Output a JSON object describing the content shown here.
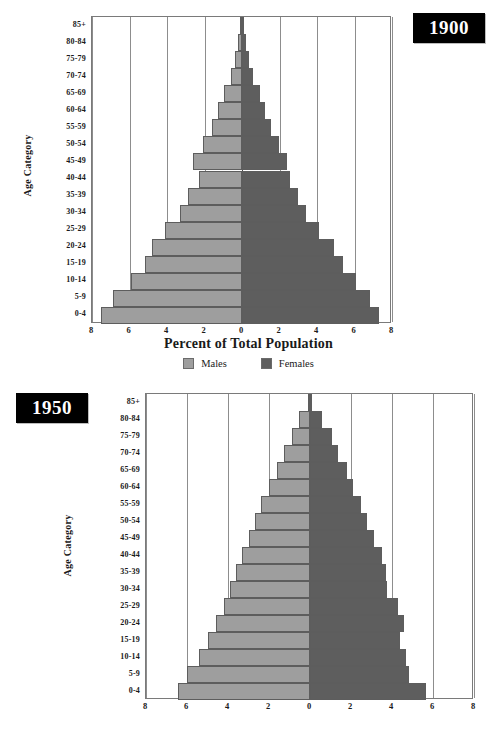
{
  "page": {
    "background": "#ffffff"
  },
  "colors": {
    "male": "#9e9e9e",
    "female": "#5e5e5e",
    "badge_background": "#000000",
    "badge_text": "#ffffff",
    "gridline": "#8d8d8d",
    "axis": "#7a7a7a"
  },
  "legend": {
    "position": "bottom-center",
    "items": [
      {
        "label": "Males",
        "color": "#9e9e9e",
        "swatch": "square-swatch"
      },
      {
        "label": "Females",
        "color": "#5e5e5e",
        "swatch": "square-swatch"
      }
    ]
  },
  "axis": {
    "ylabel": "Age Category",
    "xlabel": "Percent of Total Population",
    "xticks": [
      "8",
      "6",
      "4",
      "2",
      "0",
      "2",
      "4",
      "6",
      "8"
    ],
    "xtick_values": [
      -8,
      -6,
      -4,
      -2,
      0,
      2,
      4,
      6,
      8
    ],
    "xlim": [
      -8,
      8
    ],
    "grid": true
  },
  "chart_data": [
    {
      "id": "pyramid-1900",
      "type": "bar",
      "orientation": "horizontal-diverging",
      "title": "1900",
      "xlabel": "Percent of Total Population",
      "ylabel": "Age Category",
      "xlim": [
        -8,
        8
      ],
      "xticks": [
        -8,
        -6,
        -4,
        -2,
        0,
        2,
        4,
        6,
        8
      ],
      "xticklabels": [
        "8",
        "6",
        "4",
        "2",
        "0",
        "2",
        "4",
        "6",
        "8"
      ],
      "grid": true,
      "legend": [
        "Males",
        "Females"
      ],
      "categories": [
        "85+",
        "80-84",
        "75-79",
        "70-74",
        "65-69",
        "60-64",
        "55-59",
        "50-54",
        "45-49",
        "40-44",
        "35-39",
        "30-34",
        "25-29",
        "20-24",
        "15-19",
        "10-14",
        "5-9",
        "0-4"
      ],
      "series": [
        {
          "name": "Males",
          "color": "#9e9e9e",
          "values": [
            0.13,
            0.2,
            0.35,
            0.6,
            0.95,
            1.3,
            1.6,
            2.1,
            2.6,
            2.3,
            2.9,
            3.3,
            4.1,
            4.8,
            5.2,
            5.9,
            6.9,
            7.5
          ]
        },
        {
          "name": "Females",
          "color": "#5e5e5e",
          "values": [
            0.13,
            0.2,
            0.35,
            0.6,
            0.95,
            1.25,
            1.55,
            1.95,
            2.4,
            2.55,
            3.0,
            3.4,
            4.1,
            4.9,
            5.4,
            6.1,
            6.8,
            7.3
          ]
        }
      ]
    },
    {
      "id": "pyramid-1950",
      "type": "bar",
      "orientation": "horizontal-diverging",
      "title": "1950",
      "xlabel": "",
      "ylabel": "Age Category",
      "xlim": [
        -8,
        8
      ],
      "xticks": [
        -8,
        -6,
        -4,
        -2,
        0,
        2,
        4,
        6,
        8
      ],
      "xticklabels": [
        "8",
        "6",
        "4",
        "2",
        "0",
        "2",
        "4",
        "6",
        "8"
      ],
      "grid": true,
      "legend": [
        "Males",
        "Females"
      ],
      "categories": [
        "85+",
        "80-84",
        "75-79",
        "70-74",
        "65-69",
        "60-64",
        "55-59",
        "50-54",
        "45-49",
        "40-44",
        "35-39",
        "30-34",
        "25-29",
        "20-24",
        "15-19",
        "10-14",
        "5-9",
        "0-4"
      ],
      "series": [
        {
          "name": "Males",
          "color": "#9e9e9e",
          "values": [
            0.1,
            0.55,
            0.9,
            1.25,
            1.6,
            2.0,
            2.4,
            2.7,
            3.0,
            3.3,
            3.6,
            3.9,
            4.2,
            4.6,
            5.0,
            5.4,
            6.0,
            6.45
          ]
        },
        {
          "name": "Females",
          "color": "#5e5e5e",
          "values": [
            0.1,
            0.6,
            1.05,
            1.35,
            1.8,
            2.1,
            2.5,
            2.8,
            3.1,
            3.5,
            3.7,
            3.75,
            4.3,
            4.6,
            4.4,
            4.7,
            4.85,
            5.65
          ]
        }
      ]
    }
  ]
}
